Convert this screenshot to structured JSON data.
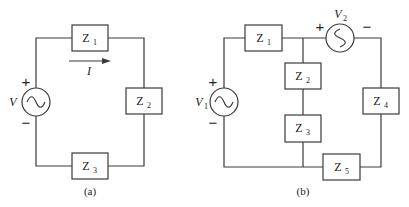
{
  "circuit_a": {
    "caption": "(a)",
    "source": {
      "label": "V",
      "plus": "+",
      "minus": "−",
      "symbol": "ac-source"
    },
    "current": {
      "label": "I",
      "direction": "right"
    },
    "impedances": [
      {
        "name": "Z",
        "sub": "1"
      },
      {
        "name": "Z",
        "sub": "2"
      },
      {
        "name": "Z",
        "sub": "3"
      }
    ]
  },
  "circuit_b": {
    "caption": "(b)",
    "source1": {
      "label": "V",
      "sub": "1",
      "plus": "+",
      "minus": "−",
      "symbol": "ac-source"
    },
    "source2": {
      "label": "V",
      "sub": "2",
      "plus": "+",
      "minus": "−",
      "symbol": "ac-source"
    },
    "impedances": [
      {
        "name": "Z",
        "sub": "1"
      },
      {
        "name": "Z",
        "sub": "2"
      },
      {
        "name": "Z",
        "sub": "3"
      },
      {
        "name": "Z",
        "sub": "4"
      },
      {
        "name": "Z",
        "sub": "5"
      }
    ]
  },
  "colors": {
    "line": "#3a3a3a",
    "text": "#222222",
    "background": "#ffffff"
  }
}
